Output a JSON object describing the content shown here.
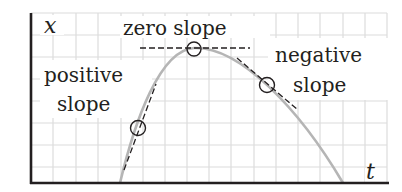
{
  "figure": {
    "type": "position-time graph with tangent slopes",
    "axes": {
      "y_label": "x",
      "x_label": "t"
    },
    "annotations": [
      {
        "id": "zero",
        "lines": [
          "zero slope"
        ]
      },
      {
        "id": "positive",
        "lines": [
          "positive",
          "slope"
        ]
      },
      {
        "id": "negative",
        "lines": [
          "negative",
          "slope"
        ]
      }
    ],
    "colors": {
      "axis": "#231f20",
      "grid": "#d9d9d9",
      "curve": "#b3b3b3",
      "tangent": "#231f20",
      "text": "#231f20"
    }
  }
}
